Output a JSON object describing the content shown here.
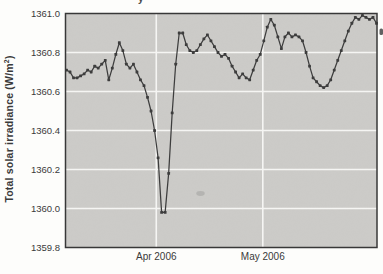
{
  "figure": {
    "top_text_fragment": "y",
    "y_axis_label": {
      "prefix": "Total solar irradiance (W/m",
      "sup": "2",
      "suffix": ")"
    }
  },
  "colors": {
    "plot_background": "#cccbc8",
    "gridline": "#f5f5f3",
    "frame": "#383838",
    "line": "#3d3d3d",
    "text": "#3a3a3a",
    "page_background": "#fdfdfb"
  },
  "chart_data": {
    "type": "line",
    "title": "",
    "xlabel": "",
    "ylabel": "Total solar irradiance (W/m2)",
    "ylim": [
      1359.8,
      1361.0
    ],
    "y_ticks": [
      1361.0,
      1360.8,
      1360.6,
      1360.4,
      1360.2,
      1360.0,
      1359.8
    ],
    "y_tick_labels": [
      "1361.0",
      "1360.8",
      "1360.6",
      "1360.4",
      "1360.2",
      "1360.0",
      "1359.8"
    ],
    "x_tick_labels": [
      "Apr 2006",
      "May 2006"
    ],
    "x_tick_positions_frac": [
      0.2914,
      0.6334
    ],
    "grid": true,
    "legend": "none",
    "marker": "square",
    "series": [
      {
        "name": "Total solar irradiance",
        "values": [
          1360.71,
          1360.7,
          1360.67,
          1360.67,
          1360.68,
          1360.69,
          1360.71,
          1360.7,
          1360.73,
          1360.72,
          1360.74,
          1360.76,
          1360.66,
          1360.72,
          1360.79,
          1360.85,
          1360.81,
          1360.74,
          1360.72,
          1360.74,
          1360.7,
          1360.66,
          1360.63,
          1360.57,
          1360.5,
          1360.4,
          1360.26,
          1359.98,
          1359.98,
          1360.18,
          1360.49,
          1360.74,
          1360.9,
          1360.9,
          1360.84,
          1360.81,
          1360.8,
          1360.81,
          1360.84,
          1360.87,
          1360.89,
          1360.86,
          1360.83,
          1360.8,
          1360.78,
          1360.79,
          1360.77,
          1360.73,
          1360.7,
          1360.67,
          1360.69,
          1360.67,
          1360.66,
          1360.71,
          1360.76,
          1360.79,
          1360.86,
          1360.93,
          1360.97,
          1360.94,
          1360.88,
          1360.82,
          1360.88,
          1360.9,
          1360.88,
          1360.89,
          1360.88,
          1360.86,
          1360.8,
          1360.73,
          1360.67,
          1360.65,
          1360.63,
          1360.62,
          1360.63,
          1360.66,
          1360.71,
          1360.76,
          1360.81,
          1360.86,
          1360.91,
          1360.95,
          1360.98,
          1360.97,
          1360.99,
          1360.98,
          1360.97,
          1360.98,
          1360.95
        ]
      }
    ]
  }
}
